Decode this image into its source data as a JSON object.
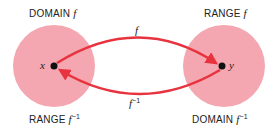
{
  "diagram": {
    "colors": {
      "set_fill": "#f4a7b0",
      "arrow": "#e8333f",
      "point": "#111111",
      "text": "#222222"
    },
    "left_set": {
      "top_label": {
        "prefix": "DOMAIN",
        "symbol": "f"
      },
      "bottom_label": {
        "prefix": "RANGE",
        "symbol": "f",
        "superscript": "−1"
      },
      "point_label": "x"
    },
    "right_set": {
      "top_label": {
        "prefix": "RANGE",
        "symbol": "f"
      },
      "bottom_label": {
        "prefix": "DOMAIN",
        "symbol": "f",
        "superscript": "−1"
      },
      "point_label": "y"
    },
    "arrows": [
      {
        "name": "f",
        "label": "f",
        "superscript": "",
        "from": "x",
        "to": "y"
      },
      {
        "name": "f-inverse",
        "label": "f",
        "superscript": "−1",
        "from": "y",
        "to": "x"
      }
    ]
  }
}
